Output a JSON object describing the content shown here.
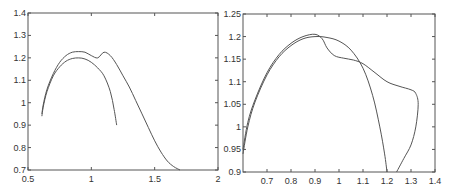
{
  "chart_data": [
    {
      "type": "line",
      "title": "",
      "xlabel": "",
      "ylabel": "",
      "xlim": [
        0.5,
        2
      ],
      "ylim": [
        0.7,
        1.4
      ],
      "grid": false,
      "legend": null,
      "xticks": [
        "0.5",
        "1",
        "1.5",
        "2"
      ],
      "yticks": [
        "0.7",
        "0.8",
        "0.9",
        "1",
        "1.1",
        "1.2",
        "1.3",
        "1.4"
      ],
      "box": {
        "left": 28,
        "top": 13,
        "right": 218,
        "bottom": 170
      },
      "series": [
        {
          "name": "curve-1",
          "x": [
            0.61,
            0.62,
            0.65,
            0.7,
            0.75,
            0.8,
            0.85,
            0.9,
            0.95,
            1.0,
            1.05,
            1.1,
            1.15,
            1.2,
            1.25,
            1.3,
            1.35,
            1.4,
            1.45,
            1.5,
            1.55,
            1.6,
            1.65,
            1.7
          ],
          "y": [
            0.95,
            0.99,
            1.06,
            1.13,
            1.18,
            1.21,
            1.225,
            1.228,
            1.225,
            1.21,
            1.2,
            1.225,
            1.21,
            1.17,
            1.12,
            1.07,
            1.01,
            0.95,
            0.89,
            0.83,
            0.78,
            0.74,
            0.715,
            0.7
          ]
        },
        {
          "name": "curve-2",
          "x": [
            0.61,
            0.62,
            0.65,
            0.7,
            0.75,
            0.8,
            0.85,
            0.9,
            0.95,
            1.0,
            1.05,
            1.1,
            1.15,
            1.18,
            1.2
          ],
          "y": [
            0.94,
            0.98,
            1.05,
            1.12,
            1.16,
            1.185,
            1.197,
            1.2,
            1.195,
            1.18,
            1.155,
            1.12,
            1.05,
            0.97,
            0.9
          ]
        }
      ]
    },
    {
      "type": "line",
      "title": "",
      "xlabel": "",
      "ylabel": "",
      "xlim": [
        0.6,
        1.4
      ],
      "ylim": [
        0.9,
        1.25
      ],
      "grid": false,
      "legend": null,
      "xticks": [
        "0.7",
        "0.8",
        "0.9",
        "1",
        "1.1",
        "1.2",
        "1.3",
        "1.4"
      ],
      "yticks": [
        "0.9",
        "0.95",
        "1",
        "1.05",
        "1.1",
        "1.15",
        "1.2",
        "1.25"
      ],
      "box": {
        "left": 243,
        "top": 14,
        "right": 435,
        "bottom": 172
      },
      "series": [
        {
          "name": "curve-1",
          "x": [
            0.6,
            0.62,
            0.65,
            0.7,
            0.75,
            0.8,
            0.85,
            0.9,
            0.93,
            0.95,
            0.98,
            1.02,
            1.06,
            1.1,
            1.15,
            1.2,
            1.25,
            1.3,
            1.32,
            1.33,
            1.32,
            1.3,
            1.27,
            1.24
          ],
          "y": [
            0.95,
            1.01,
            1.06,
            1.12,
            1.16,
            1.185,
            1.2,
            1.205,
            1.195,
            1.175,
            1.158,
            1.152,
            1.148,
            1.14,
            1.12,
            1.1,
            1.09,
            1.082,
            1.074,
            1.05,
            1.0,
            0.96,
            0.93,
            0.9
          ]
        },
        {
          "name": "curve-2",
          "x": [
            0.6,
            0.62,
            0.65,
            0.7,
            0.75,
            0.8,
            0.85,
            0.9,
            0.95,
            1.0,
            1.05,
            1.1,
            1.14,
            1.17,
            1.19,
            1.2
          ],
          "y": [
            0.94,
            1.0,
            1.055,
            1.115,
            1.155,
            1.18,
            1.195,
            1.2,
            1.198,
            1.19,
            1.17,
            1.13,
            1.07,
            1.0,
            0.94,
            0.9
          ]
        }
      ]
    }
  ]
}
